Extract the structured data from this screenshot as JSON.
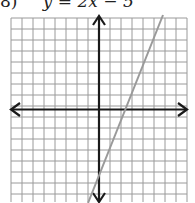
{
  "problem": {
    "number": "8)",
    "equation": "y = 2x − 5"
  },
  "chart_data": {
    "type": "line",
    "title": "y = 2x − 5",
    "xlabel": "",
    "ylabel": "",
    "xlim": [
      -8,
      8
    ],
    "ylim": [
      -8,
      8
    ],
    "grid": true,
    "series": [
      {
        "name": "y = 2x − 5",
        "slope": 2,
        "intercept": -5,
        "x": [
          -1.0,
          5.7
        ],
        "y": [
          -7,
          6.4
        ]
      }
    ],
    "x_intercept": 2.5,
    "y_intercept": -5,
    "colors": {
      "grid": "#9a9a9a",
      "axis": "#1a1a1a",
      "line": "#9a9a9a"
    }
  }
}
